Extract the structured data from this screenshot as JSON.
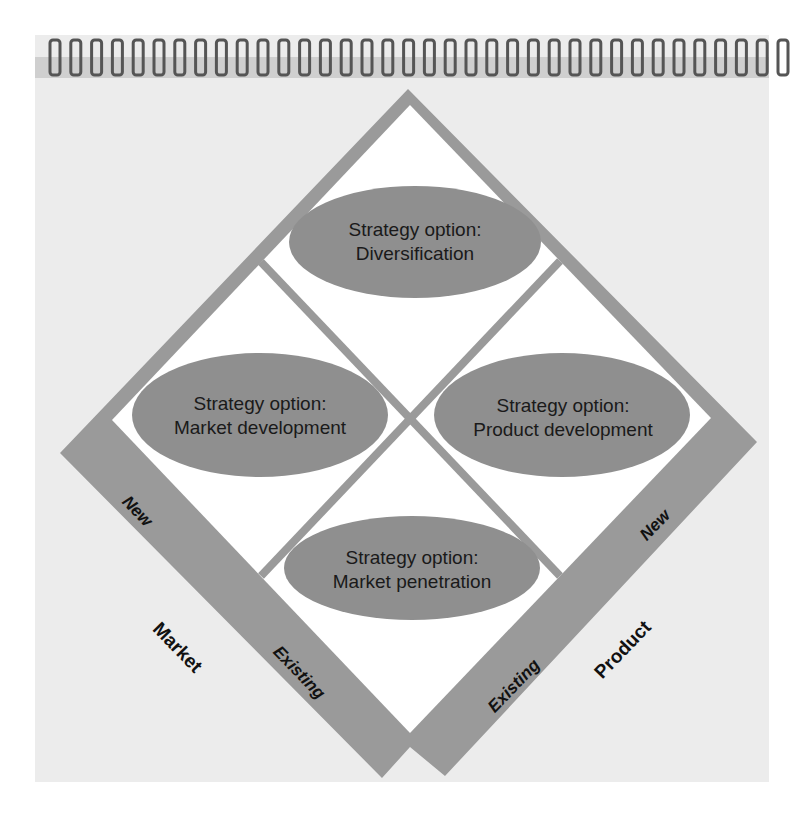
{
  "diagram": {
    "type": "ansoff-matrix",
    "colors": {
      "page": "#ececec",
      "band": "#9a9a9a",
      "cell": "#ffffff",
      "ellipse": "#8f8f8f",
      "text": "#1a1a1a"
    },
    "quadrants": [
      {
        "id": "top",
        "line1": "Strategy option:",
        "line2": "Diversification"
      },
      {
        "id": "left",
        "line1": "Strategy option:",
        "line2": "Market development"
      },
      {
        "id": "right",
        "line1": "Strategy option:",
        "line2": "Product development"
      },
      {
        "id": "bottom",
        "line1": "Strategy option:",
        "line2": "Market penetration"
      }
    ],
    "market_axis": {
      "name": "Market",
      "values": [
        "New",
        "Existing"
      ]
    },
    "product_axis": {
      "name": "Product",
      "values": [
        "New",
        "Existing"
      ]
    },
    "spiral_rings": 36
  }
}
